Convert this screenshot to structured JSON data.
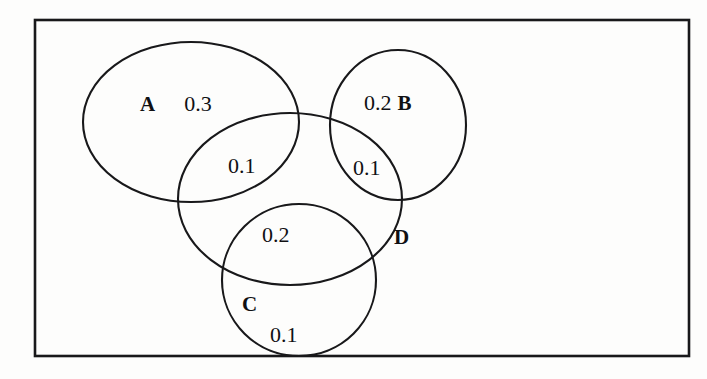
{
  "diagram": {
    "kind": "venn-diagram",
    "frame": {
      "stroke_color": "#18181a",
      "background_color": "#fdfdfc"
    },
    "sets": [
      {
        "id": "A",
        "label": "A",
        "shape": "ellipse",
        "cx": 191,
        "cy": 122,
        "rx": 108,
        "ry": 80,
        "rotation": 0
      },
      {
        "id": "B",
        "label": "B",
        "shape": "ellipse",
        "cx": 398,
        "cy": 125,
        "rx": 68,
        "ry": 75,
        "rotation": 0
      },
      {
        "id": "C",
        "label": "C",
        "shape": "ellipse",
        "cx": 299,
        "cy": 280,
        "rx": 77,
        "ry": 76,
        "rotation": 0
      },
      {
        "id": "D",
        "label": "D",
        "shape": "ellipse",
        "cx": 290,
        "cy": 199,
        "rx": 112,
        "ry": 86,
        "rotation": 0
      }
    ],
    "regions": [
      {
        "id": "A-only",
        "set_label": "A",
        "value": "0.3"
      },
      {
        "id": "B-only",
        "set_label": "B",
        "value": "0.2"
      },
      {
        "id": "A-intersect-D",
        "set_label": "",
        "value": "0.1"
      },
      {
        "id": "B-intersect-D",
        "set_label": "",
        "value": "0.1"
      },
      {
        "id": "C-intersect-D",
        "set_label": "",
        "value": "0.2"
      },
      {
        "id": "C-only",
        "set_label": "C",
        "value": "0.1"
      },
      {
        "id": "D-label",
        "set_label": "D",
        "value": ""
      }
    ],
    "labels": {
      "a_set": "A",
      "a_value": "0.3",
      "b_value": "0.2",
      "b_set": "B",
      "ad_value": "0.1",
      "bd_value": "0.1",
      "cd_value": "0.2",
      "c_set": "C",
      "c_value": "0.1",
      "d_set": "D"
    }
  }
}
